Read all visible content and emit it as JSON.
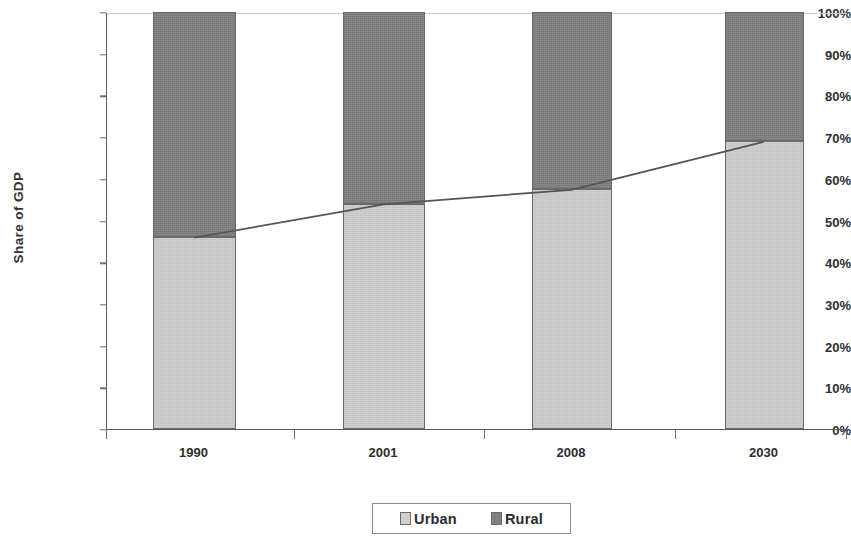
{
  "chart_data": {
    "type": "bar",
    "subtype": "stacked-100-percent-with-line-overlay",
    "title": "",
    "xlabel": "",
    "ylabel": "Share of GDP",
    "categories": [
      "1990",
      "2001",
      "2008",
      "2030"
    ],
    "ylim": [
      0,
      100
    ],
    "ytick_labels": [
      "0%",
      "10%",
      "20%",
      "30%",
      "40%",
      "50%",
      "60%",
      "70%",
      "80%",
      "90%",
      "100%"
    ],
    "ytick_values": [
      0,
      10,
      20,
      30,
      40,
      50,
      60,
      70,
      80,
      90,
      100
    ],
    "grid": false,
    "legend_position": "bottom-center",
    "series": [
      {
        "name": "Urban",
        "color": "#cfcfcf",
        "values": [
          46,
          54,
          57.5,
          69
        ]
      },
      {
        "name": "Rural",
        "color": "#808080",
        "values": [
          54,
          46,
          42.5,
          31
        ]
      }
    ],
    "overlay_line": {
      "name": "Urban share trend",
      "color": "#555555",
      "values": [
        46,
        54,
        57.5,
        69
      ]
    }
  },
  "axes": {
    "y_title": "Share of GDP"
  },
  "legend": {
    "entries": [
      {
        "label": "Urban",
        "swatch": "urban"
      },
      {
        "label": "Rural",
        "swatch": "rural"
      }
    ]
  },
  "colors": {
    "urban": "#cfcfcf",
    "rural": "#808080",
    "axis": "#5a5a5a",
    "line": "#555555"
  }
}
